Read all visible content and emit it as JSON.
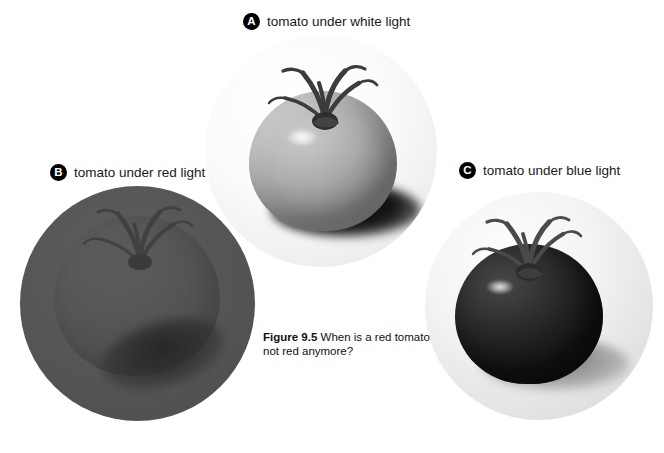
{
  "figure": {
    "caption_label": "Figure 9.5",
    "caption_text": "When is a red tomato not red anymore?",
    "background_color": "#ffffff",
    "badge_color": "#000000",
    "badge_text_color": "#ffffff"
  },
  "panels": [
    {
      "badge": "A",
      "label": "tomato under white light",
      "subject": "tomato",
      "lighting": "white light",
      "appearance": "light gray tomato, glossy highlight, dark cast shadow to lower right",
      "vignette_color": "#f4f4f4",
      "tomato_color": "#b4b4b4",
      "shadow_color": "#121212"
    },
    {
      "badge": "B",
      "label": "tomato under red light",
      "subject": "tomato",
      "lighting": "red light",
      "appearance": "tomato blends into flat mid-gray field, only calyx and cast shadow visible",
      "vignette_color": "#545454",
      "tomato_color": "#575757",
      "shadow_color": "#2a2a2a"
    },
    {
      "badge": "C",
      "label": "tomato under blue light",
      "subject": "tomato",
      "lighting": "blue light",
      "appearance": "very dark, nearly black tomato with bright specular highlight on pale gray field",
      "vignette_color": "#e8e8e8",
      "tomato_color": "#242424",
      "shadow_color": "#8c8c8c"
    }
  ]
}
